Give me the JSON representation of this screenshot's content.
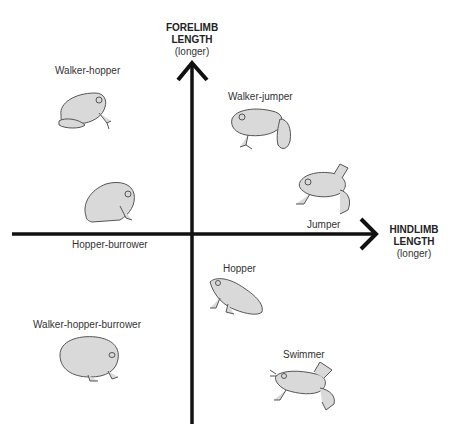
{
  "diagram": {
    "y_axis": {
      "line1": "FORELIMB",
      "line2": "LENGTH",
      "note": "(longer)"
    },
    "x_axis": {
      "line1": "HINDLIMB",
      "line2": "LENGTH",
      "note": "(longer)"
    },
    "categories": [
      {
        "label": "Walker-hopper",
        "quadrant": "upper-left"
      },
      {
        "label": "Walker-jumper",
        "quadrant": "upper-right"
      },
      {
        "label": "Jumper",
        "quadrant": "upper-right"
      },
      {
        "label": "Hopper-burrower",
        "quadrant": "upper-left"
      },
      {
        "label": "Hopper",
        "quadrant": "lower-right"
      },
      {
        "label": "Walker-hopper-burrower",
        "quadrant": "lower-left"
      },
      {
        "label": "Swimmer",
        "quadrant": "lower-right"
      }
    ],
    "colors": {
      "axis": "#111111",
      "frog_fill": "#d9d9d9",
      "frog_stroke": "#555555"
    }
  }
}
